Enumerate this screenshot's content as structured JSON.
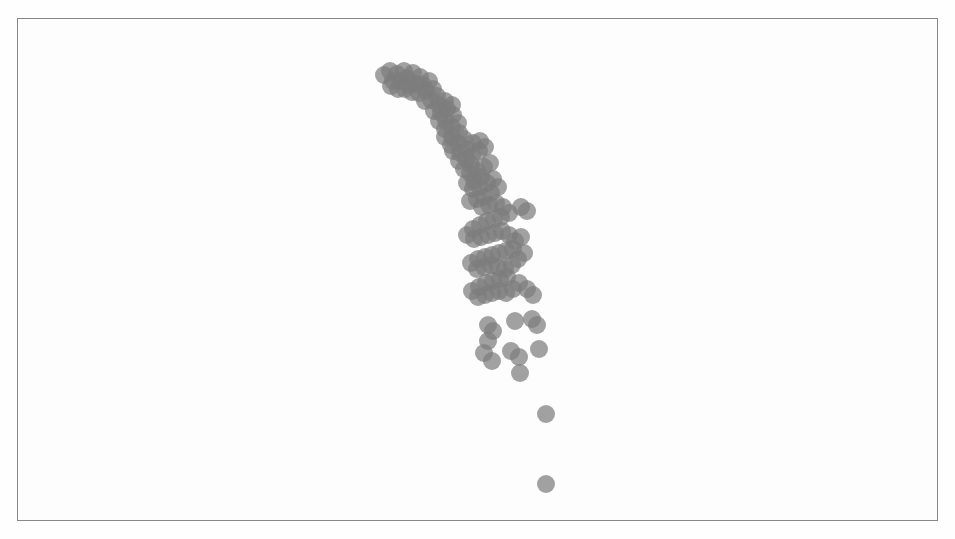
{
  "figure": {
    "kind": "scatter-plot-figure",
    "background_color": "#fdfdfd",
    "frame_color": "#8e8e92",
    "frame": {
      "x": 17,
      "y": 18,
      "width": 921,
      "height": 503
    },
    "title": "",
    "caption": ""
  },
  "chart_data": {
    "type": "scatter",
    "title": "",
    "subtitle": "",
    "xlabel": "",
    "ylabel": "",
    "xlim": [
      0,
      921
    ],
    "ylim": [
      0,
      503
    ],
    "grid": false,
    "legend": null,
    "axis_ticks_visible": false,
    "axis_tick_labels": [],
    "marker": {
      "shape": "circle",
      "radius_px": 9,
      "color": "#7d7d7d",
      "opacity": 0.72,
      "edge_color": "none"
    },
    "annotations": [],
    "series": [
      {
        "name": "observations",
        "color": "#7d7d7d",
        "n_points": 132,
        "points": [
          [
            383,
            74
          ],
          [
            389,
            70
          ],
          [
            396,
            73
          ],
          [
            403,
            70
          ],
          [
            392,
            80
          ],
          [
            399,
            80
          ],
          [
            406,
            77
          ],
          [
            412,
            72
          ],
          [
            419,
            76
          ],
          [
            408,
            84
          ],
          [
            415,
            83
          ],
          [
            422,
            84
          ],
          [
            428,
            80
          ],
          [
            425,
            90
          ],
          [
            432,
            88
          ],
          [
            418,
            92
          ],
          [
            411,
            91
          ],
          [
            404,
            88
          ],
          [
            397,
            88
          ],
          [
            390,
            85
          ],
          [
            436,
            95
          ],
          [
            430,
            99
          ],
          [
            424,
            100
          ],
          [
            438,
            104
          ],
          [
            444,
            100
          ],
          [
            433,
            110
          ],
          [
            440,
            112
          ],
          [
            446,
            108
          ],
          [
            451,
            104
          ],
          [
            452,
            114
          ],
          [
            445,
            120
          ],
          [
            438,
            120
          ],
          [
            444,
            128
          ],
          [
            451,
            126
          ],
          [
            457,
            122
          ],
          [
            458,
            132
          ],
          [
            451,
            136
          ],
          [
            444,
            136
          ],
          [
            450,
            144
          ],
          [
            457,
            142
          ],
          [
            463,
            138
          ],
          [
            466,
            148
          ],
          [
            459,
            152
          ],
          [
            452,
            150
          ],
          [
            458,
            160
          ],
          [
            465,
            158
          ],
          [
            471,
            154
          ],
          [
            478,
            150
          ],
          [
            484,
            146
          ],
          [
            479,
            140
          ],
          [
            472,
            142
          ],
          [
            470,
            164
          ],
          [
            463,
            168
          ],
          [
            469,
            172
          ],
          [
            476,
            170
          ],
          [
            483,
            166
          ],
          [
            489,
            162
          ],
          [
            480,
            176
          ],
          [
            473,
            180
          ],
          [
            466,
            182
          ],
          [
            472,
            188
          ],
          [
            479,
            186
          ],
          [
            486,
            182
          ],
          [
            492,
            178
          ],
          [
            497,
            186
          ],
          [
            490,
            192
          ],
          [
            483,
            196
          ],
          [
            476,
            198
          ],
          [
            469,
            200
          ],
          [
            520,
            206
          ],
          [
            526,
            210
          ],
          [
            481,
            206
          ],
          [
            488,
            204
          ],
          [
            495,
            202
          ],
          [
            502,
            206
          ],
          [
            508,
            212
          ],
          [
            500,
            216
          ],
          [
            493,
            218
          ],
          [
            486,
            220
          ],
          [
            479,
            224
          ],
          [
            472,
            228
          ],
          [
            466,
            234
          ],
          [
            473,
            238
          ],
          [
            480,
            236
          ],
          [
            487,
            234
          ],
          [
            494,
            232
          ],
          [
            501,
            230
          ],
          [
            508,
            234
          ],
          [
            514,
            240
          ],
          [
            520,
            236
          ],
          [
            512,
            248
          ],
          [
            505,
            250
          ],
          [
            498,
            252
          ],
          [
            491,
            254
          ],
          [
            484,
            256
          ],
          [
            477,
            258
          ],
          [
            470,
            262
          ],
          [
            476,
            268
          ],
          [
            483,
            266
          ],
          [
            490,
            264
          ],
          [
            497,
            266
          ],
          [
            504,
            268
          ],
          [
            511,
            264
          ],
          [
            517,
            258
          ],
          [
            523,
            252
          ],
          [
            506,
            276
          ],
          [
            499,
            278
          ],
          [
            492,
            280
          ],
          [
            485,
            282
          ],
          [
            478,
            286
          ],
          [
            471,
            290
          ],
          [
            477,
            296
          ],
          [
            484,
            294
          ],
          [
            491,
            292
          ],
          [
            498,
            290
          ],
          [
            505,
            292
          ],
          [
            512,
            288
          ],
          [
            518,
            282
          ],
          [
            526,
            288
          ],
          [
            532,
            294
          ],
          [
            487,
            324
          ],
          [
            492,
            330
          ],
          [
            487,
            340
          ],
          [
            531,
            318
          ],
          [
            536,
            324
          ],
          [
            514,
            320
          ],
          [
            538,
            348
          ],
          [
            510,
            350
          ],
          [
            518,
            356
          ],
          [
            483,
            352
          ],
          [
            491,
            360
          ],
          [
            519,
            372
          ],
          [
            545,
            413
          ],
          [
            545,
            483
          ]
        ]
      }
    ]
  }
}
